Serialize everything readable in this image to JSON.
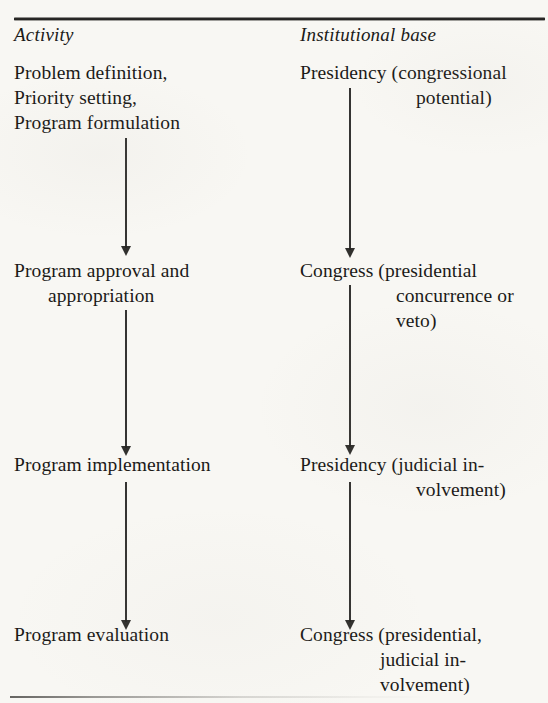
{
  "figure": {
    "type": "flow-diagram",
    "orientation": "two-column vertical flow",
    "row_count": 4,
    "ink_color": "#1b1a18",
    "paper_color": "#f8f7f3"
  },
  "columns": {
    "left_header": "Activity",
    "right_header": "Institutional base"
  },
  "rows": [
    {
      "activity": {
        "lines": [
          "Problem definition,",
          "Priority setting,",
          "Program formulation"
        ]
      },
      "institution": {
        "lines": [
          "Presidency (congressional",
          "potential)"
        ]
      }
    },
    {
      "activity": {
        "lines": [
          "Program approval and",
          "appropriation"
        ]
      },
      "institution": {
        "lines": [
          "Congress (presidential",
          "concurrence or",
          "veto)"
        ]
      }
    },
    {
      "activity": {
        "lines": [
          "Program implementation"
        ]
      },
      "institution": {
        "lines": [
          "Presidency (judicial in-",
          "volvement)"
        ]
      }
    },
    {
      "activity": {
        "lines": [
          "Program evaluation"
        ]
      },
      "institution": {
        "lines": [
          "Congress (presidential,",
          "judicial in-",
          "volvement)"
        ]
      }
    }
  ],
  "connectors": {
    "left_column_arrows": 3,
    "right_column_arrows": 3,
    "glyph": "down-arrow"
  }
}
